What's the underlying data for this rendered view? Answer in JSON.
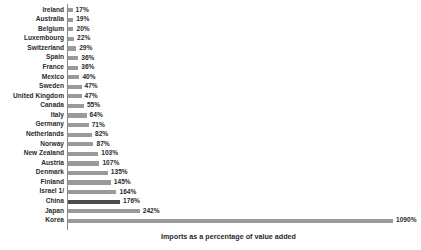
{
  "chart_data": {
    "type": "bar",
    "orientation": "horizontal",
    "title": "",
    "xlabel": "Imports as a percentage of value added",
    "ylabel": "",
    "grid": false,
    "legend": null,
    "xlim": [
      0,
      1090
    ],
    "value_suffix": "%",
    "highlight_category": "China",
    "colors": {
      "bar": "#9a9a9a",
      "bar_highlight": "#4d4d4d",
      "axis": "#8a8a8a",
      "text": "#2b2b2b",
      "background": "#ffffff"
    },
    "categories": [
      "Ireland",
      "Australia",
      "Belgium",
      "Luxembourg",
      "Switzerland",
      "Spain",
      "France",
      "Mexico",
      "Sweden",
      "United Kingdom",
      "Canada",
      "Italy",
      "Germany",
      "Netherlands",
      "Norway",
      "New Zealand",
      "Austria",
      "Denmark",
      "Finland",
      "Israel 1/",
      "China",
      "Japan",
      "Korea"
    ],
    "values": [
      17,
      19,
      20,
      22,
      29,
      36,
      36,
      40,
      47,
      47,
      55,
      64,
      71,
      82,
      87,
      103,
      107,
      135,
      145,
      164,
      176,
      242,
      1090
    ],
    "value_labels": [
      "17%",
      "19%",
      "20%",
      "22%",
      "29%",
      "36%",
      "36%",
      "40%",
      "47%",
      "47%",
      "55%",
      "64%",
      "71%",
      "82%",
      "87%",
      "103%",
      "107%",
      "135%",
      "145%",
      "164%",
      "176%",
      "242%",
      "1090%"
    ],
    "footnotes": [
      "1/"
    ]
  }
}
